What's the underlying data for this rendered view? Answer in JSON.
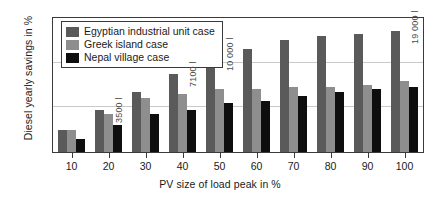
{
  "chart_data": {
    "type": "bar",
    "title": "",
    "xlabel": "PV size of load peak in %",
    "ylabel": "Diesel yearly savings in %",
    "categories": [
      "10",
      "20",
      "30",
      "40",
      "50",
      "60",
      "70",
      "80",
      "90",
      "100"
    ],
    "ylim": [
      0,
      30
    ],
    "yticks": [
      0,
      10,
      20,
      30
    ],
    "grid": true,
    "legend_position": "upper-left",
    "series": [
      {
        "name": "Egyptian industrial unit case",
        "color": "#5a5a5a",
        "values": [
          5.0,
          9.5,
          13.5,
          17.5,
          21.0,
          23.0,
          25.0,
          26.0,
          26.5,
          27.0
        ]
      },
      {
        "name": "Greek island case",
        "color": "#8e8e8e",
        "values": [
          5.0,
          8.5,
          12.0,
          13.0,
          14.0,
          14.0,
          14.5,
          14.5,
          15.0,
          16.0
        ]
      },
      {
        "name": "Nepal village case",
        "color": "#0e0e0e",
        "values": [
          3.0,
          6.0,
          8.5,
          9.5,
          11.0,
          11.5,
          12.5,
          13.5,
          14.0,
          14.5
        ]
      }
    ],
    "annotations": [
      {
        "text": "3500 l",
        "category": "20",
        "orientation": "vertical"
      },
      {
        "text": "7100 l",
        "category": "40",
        "orientation": "vertical"
      },
      {
        "text": "10 000 l",
        "category": "50",
        "orientation": "vertical"
      },
      {
        "text": "19 000 l",
        "category": "100",
        "orientation": "vertical"
      }
    ]
  },
  "axes": {
    "y_title": "Diesel yearly savings in %",
    "x_title": "PV size of load peak in %",
    "y_ticks": [
      "0",
      "10",
      "20",
      "30"
    ],
    "x_ticks": [
      "10",
      "20",
      "30",
      "40",
      "50",
      "60",
      "70",
      "80",
      "90",
      "100"
    ]
  },
  "legend": {
    "items": [
      {
        "label": "Egyptian industrial unit case"
      },
      {
        "label": "Greek island case"
      },
      {
        "label": "Nepal village case"
      }
    ]
  }
}
